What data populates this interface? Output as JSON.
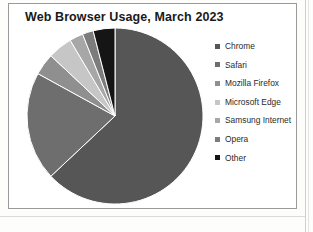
{
  "chart": {
    "title": "Web Browser Usage, March 2023",
    "background": "#ffffff",
    "border_color": "#9a9a9a"
  },
  "legend": {
    "position": "right",
    "marker": "square"
  },
  "chart_data": {
    "type": "pie",
    "title": "Web Browser Usage, March 2023",
    "xlabel": "",
    "ylabel": "",
    "legend_position": "right",
    "grid": false,
    "start_angle_deg": 0,
    "direction": "clockwise",
    "categories": [
      "Chrome",
      "Safari",
      "Mozilla Firefox",
      "Microsoft Edge",
      "Samsung Internet",
      "Opera",
      "Other"
    ],
    "values": [
      63,
      20,
      4,
      4.5,
      2.5,
      2,
      4
    ],
    "labels": [
      {
        "name": "Chrome",
        "value": 63,
        "color": "#565656"
      },
      {
        "name": "Safari",
        "value": 20,
        "color": "#6e6e6e"
      },
      {
        "name": "Mozilla Firefox",
        "value": 4,
        "color": "#8f8f8f"
      },
      {
        "name": "Microsoft Edge",
        "value": 4.5,
        "color": "#c6c6c6"
      },
      {
        "name": "Samsung Internet",
        "value": 2.5,
        "color": "#a7a7a7"
      },
      {
        "name": "Opera",
        "value": 2,
        "color": "#7c7c7c"
      },
      {
        "name": "Other",
        "value": 4,
        "color": "#151515"
      }
    ]
  }
}
